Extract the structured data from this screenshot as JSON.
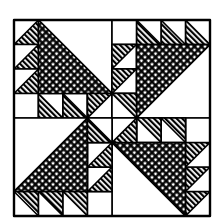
{
  "figure": {
    "colors": {
      "ink": "#000000",
      "paper": "#ffffff"
    },
    "grid": {
      "cols": 8,
      "rows": 8,
      "origin_x": 14,
      "origin_y": 20,
      "cell": 24.5
    }
  }
}
